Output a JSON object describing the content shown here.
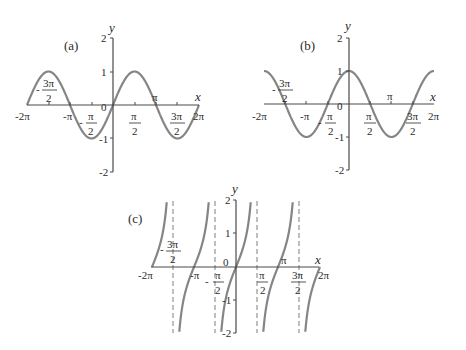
{
  "chart_data": [
    {
      "id": "a",
      "type": "line",
      "panel_label": "(a)",
      "function": "sin",
      "title": "",
      "xlabel": "x",
      "ylabel": "y",
      "xlim": [
        "-2π",
        "2π"
      ],
      "ylim": [
        -2,
        2
      ],
      "x_ticks": [
        "-2π",
        "-3π/2",
        "-π",
        "-π/2",
        "0",
        "π/2",
        "π",
        "3π/2",
        "2π"
      ],
      "y_ticks": [
        "2",
        "1",
        "0",
        "-1",
        "-2"
      ],
      "x_points": [
        "-2π",
        "-3π/2",
        "-π",
        "-π/2",
        "0",
        "π/2",
        "π",
        "3π/2",
        "2π"
      ],
      "values": [
        0,
        1,
        0,
        -1,
        0,
        1,
        0,
        -1,
        0
      ],
      "grid": false,
      "asymptotes": []
    },
    {
      "id": "b",
      "type": "line",
      "panel_label": "(b)",
      "function": "cos",
      "title": "",
      "xlabel": "x",
      "ylabel": "y",
      "xlim": [
        "-2π",
        "2π"
      ],
      "ylim": [
        -2,
        2
      ],
      "x_ticks": [
        "-2π",
        "-3π/2",
        "-π",
        "-π/2",
        "0",
        "π/2",
        "π",
        "3π/2",
        "2π"
      ],
      "y_ticks": [
        "2",
        "1",
        "0",
        "-1",
        "-2"
      ],
      "x_points": [
        "-2π",
        "-3π/2",
        "-π",
        "-π/2",
        "0",
        "π/2",
        "π",
        "3π/2",
        "2π"
      ],
      "values": [
        1,
        0,
        -1,
        0,
        1,
        0,
        -1,
        0,
        1
      ],
      "grid": false,
      "asymptotes": []
    },
    {
      "id": "c",
      "type": "line",
      "panel_label": "(c)",
      "function": "tan",
      "title": "",
      "xlabel": "x",
      "ylabel": "y",
      "xlim": [
        "-2π",
        "2π"
      ],
      "ylim": [
        -2,
        2
      ],
      "x_ticks": [
        "-2π",
        "-3π/2",
        "-π",
        "-π/2",
        "0",
        "π/2",
        "π",
        "3π/2",
        "2π"
      ],
      "y_ticks": [
        "2",
        "1",
        "0",
        "-1",
        "-2"
      ],
      "x_points": [
        "-2π",
        "-π",
        "0",
        "π",
        "2π"
      ],
      "values": [
        0,
        0,
        0,
        0,
        0
      ],
      "grid": false,
      "asymptotes": [
        "-3π/2",
        "-π/2",
        "π/2",
        "3π/2"
      ]
    }
  ],
  "labels": {
    "a": {
      "panel": "(a)",
      "x": "x",
      "y": "y",
      "y2": "2",
      "y1": "1",
      "y0": "0",
      "ym1": "-1",
      "ym2": "-2",
      "m2pi": "-2π",
      "mpi": "-π",
      "pi": "π",
      "p2pi": "2π",
      "m3pi2_num": "3π",
      "m3pi2_den": "2",
      "m3pi2_sign": "-",
      "mpi2_num": "π",
      "mpi2_den": "2",
      "mpi2_sign": "-",
      "pi2_num": "π",
      "pi2_den": "2",
      "p3pi2_num": "3π",
      "p3pi2_den": "2"
    },
    "b": {
      "panel": "(b)",
      "x": "x",
      "y": "y",
      "y2": "2",
      "y1": "1",
      "y0": "0",
      "ym1": "-1",
      "ym2": "-2",
      "m2pi": "-2π",
      "mpi": "-π",
      "pi": "π",
      "p2pi": "2π",
      "m3pi2_num": "3π",
      "m3pi2_den": "2",
      "m3pi2_sign": "-",
      "mpi2_num": "π",
      "mpi2_den": "2",
      "mpi2_sign": "-",
      "pi2_num": "π",
      "pi2_den": "2",
      "p3pi2_num": "3π",
      "p3pi2_den": "2"
    },
    "c": {
      "panel": "(c)",
      "x": "x",
      "y": "y",
      "y2": "2",
      "y1": "1",
      "y0": "0",
      "ym1": "-1",
      "ym2": "-2",
      "m2pi": "-2π",
      "mpi": "-π",
      "pi": "π",
      "p2pi": "2π",
      "m3pi2_num": "3π",
      "m3pi2_den": "2",
      "m3pi2_sign": "-",
      "mpi2_num": "π",
      "mpi2_den": "2",
      "mpi2_sign": "-",
      "pi2_num": "π",
      "pi2_den": "2",
      "p3pi2_num": "3π",
      "p3pi2_den": "2"
    }
  },
  "colors": {
    "curve": "#858585",
    "axis": "#4a4a4a",
    "asymptote": "#8a8a8a",
    "text": "#2b2b2b"
  }
}
